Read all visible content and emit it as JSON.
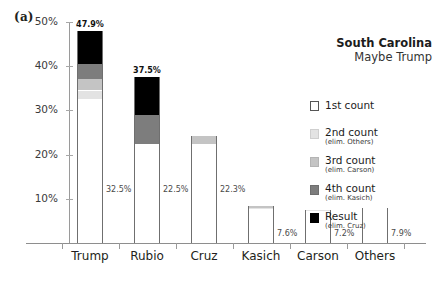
{
  "panel_label": "(a)",
  "title": {
    "line1": "South Carolina",
    "line2": "Maybe Trump"
  },
  "axis": {
    "yticks": [
      "10%",
      "20%",
      "30%",
      "40%",
      "50%"
    ]
  },
  "legend": {
    "items": [
      {
        "main": "1st count",
        "sub": "",
        "swatch": "s1"
      },
      {
        "main": "2nd count",
        "sub": "(elim. Others)",
        "swatch": "s2"
      },
      {
        "main": "3rd count",
        "sub": "(elim. Carson)",
        "swatch": "s3"
      },
      {
        "main": "4th count",
        "sub": "(elim. Kasich)",
        "swatch": "s4"
      },
      {
        "main": "Result",
        "sub": "(elim. Cruz)",
        "swatch": "s5"
      }
    ]
  },
  "chart_data": {
    "type": "bar",
    "subtype": "stacked-bar",
    "xlabel": "",
    "ylabel": "",
    "ylim": [
      0,
      53
    ],
    "grid": false,
    "legend_position": "right",
    "categories": [
      "Trump",
      "Rubio",
      "Cruz",
      "Kasich",
      "Carson",
      "Others"
    ],
    "series": [
      {
        "name": "1st count",
        "values": [
          32.5,
          22.5,
          22.3,
          7.6,
          7.2,
          7.9
        ]
      },
      {
        "name": "2nd count (elim. Others)",
        "values": [
          34.5,
          22.5,
          22.3,
          7.9,
          7.5,
          0
        ]
      },
      {
        "name": "3rd count (elim. Carson)",
        "values": [
          37.2,
          22.5,
          24.3,
          8.4,
          0,
          0
        ]
      },
      {
        "name": "4th count (elim. Kasich)",
        "values": [
          40.6,
          29.0,
          24.3,
          0,
          0,
          0
        ]
      },
      {
        "name": "Result (elim. Cruz)",
        "values": [
          47.9,
          37.5,
          0,
          0,
          0,
          0
        ]
      }
    ],
    "bar_top_labels": [
      "47.9%",
      "37.5%",
      "",
      "",
      "",
      ""
    ],
    "bar_side_labels": [
      "32.5%",
      "22.5%",
      "22.3%",
      "7.6%",
      "7.2%",
      "7.9%"
    ]
  }
}
